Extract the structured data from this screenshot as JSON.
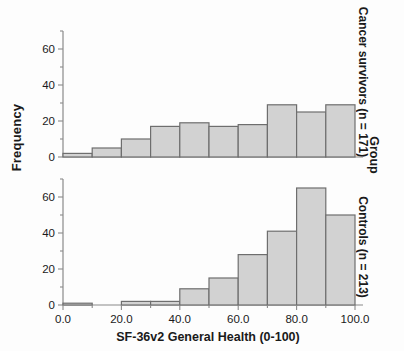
{
  "chart_data": {
    "type": "bar",
    "title": "",
    "xlabel": "SF-36v2 General Health (0-100)",
    "ylabel": "Frequency",
    "group_label": "Group",
    "xlim": [
      0,
      100
    ],
    "xticks": [
      0,
      20,
      40,
      60,
      80,
      100
    ],
    "xticklabels": [
      "0.0",
      "20.0",
      "40.0",
      "60.0",
      "80.0",
      "100.0"
    ],
    "grid": false,
    "legend": "none",
    "bin_edges": [
      0,
      10,
      20,
      30,
      40,
      50,
      60,
      70,
      80,
      90,
      100
    ],
    "bin_centers": [
      5,
      15,
      25,
      35,
      45,
      55,
      65,
      75,
      85,
      95
    ],
    "panels": [
      {
        "name": "Cancer survivors (n = 171)",
        "ylim": [
          0,
          70
        ],
        "yticks": [
          0,
          20,
          40,
          60
        ],
        "yticklabels": [
          "0",
          "20",
          "40",
          "60"
        ],
        "values": [
          2,
          5,
          10,
          17,
          19,
          17,
          18,
          29,
          25,
          29
        ]
      },
      {
        "name": "Controls (n = 213)",
        "ylim": [
          0,
          70
        ],
        "yticks": [
          0,
          20,
          40,
          60
        ],
        "yticklabels": [
          "0",
          "20",
          "40",
          "60"
        ],
        "values": [
          1,
          0,
          2,
          2,
          9,
          15,
          28,
          41,
          65,
          50
        ]
      }
    ],
    "bar_fill": "#d2d2d2",
    "bar_stroke": "#6e6e6e",
    "axis_color": "#8a8a8a"
  }
}
